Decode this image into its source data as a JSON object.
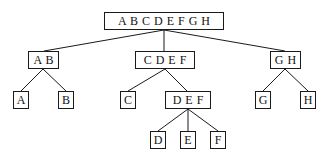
{
  "diagram": {
    "type": "binary-split tree",
    "nodes": [
      {
        "id": "root",
        "label": "A B C D E F G H",
        "x": 104,
        "y": 12,
        "w": 120,
        "h": 18
      },
      {
        "id": "ab",
        "label": "A B",
        "x": 28,
        "y": 51,
        "w": 31,
        "h": 18
      },
      {
        "id": "cdef",
        "label": "C D E F",
        "x": 135,
        "y": 51,
        "w": 60,
        "h": 18
      },
      {
        "id": "gh",
        "label": "G H",
        "x": 270,
        "y": 51,
        "w": 31,
        "h": 18
      },
      {
        "id": "a",
        "label": "A",
        "x": 13,
        "y": 91,
        "w": 16,
        "h": 18
      },
      {
        "id": "b",
        "label": "B",
        "x": 58,
        "y": 91,
        "w": 16,
        "h": 18
      },
      {
        "id": "c",
        "label": "C",
        "x": 120,
        "y": 91,
        "w": 16,
        "h": 18
      },
      {
        "id": "def",
        "label": "D E F",
        "x": 165,
        "y": 91,
        "w": 46,
        "h": 18
      },
      {
        "id": "g",
        "label": "G",
        "x": 255,
        "y": 91,
        "w": 16,
        "h": 18
      },
      {
        "id": "h",
        "label": "H",
        "x": 300,
        "y": 91,
        "w": 16,
        "h": 18
      },
      {
        "id": "d",
        "label": "D",
        "x": 150,
        "y": 131,
        "w": 16,
        "h": 18
      },
      {
        "id": "e",
        "label": "E",
        "x": 180,
        "y": 131,
        "w": 16,
        "h": 18
      },
      {
        "id": "f",
        "label": "F",
        "x": 210,
        "y": 131,
        "w": 16,
        "h": 18
      }
    ],
    "edges": [
      [
        "root",
        "ab"
      ],
      [
        "root",
        "cdef"
      ],
      [
        "root",
        "gh"
      ],
      [
        "ab",
        "a"
      ],
      [
        "ab",
        "b"
      ],
      [
        "cdef",
        "c"
      ],
      [
        "cdef",
        "def"
      ],
      [
        "gh",
        "g"
      ],
      [
        "gh",
        "h"
      ],
      [
        "def",
        "d"
      ],
      [
        "def",
        "e"
      ],
      [
        "def",
        "f"
      ]
    ],
    "colors": {
      "stroke": "#1a1a1a",
      "background": "#ffffff",
      "text": "#111111"
    }
  }
}
